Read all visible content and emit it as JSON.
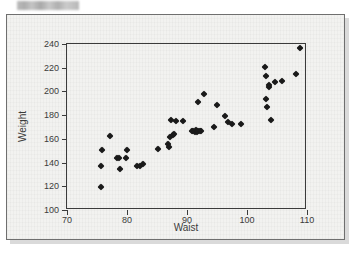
{
  "figure": {
    "redacted_caption": "",
    "background_color": "#f2f2f0",
    "frame_color": "#3b3b3b",
    "marker_color": "#1a1a1a"
  },
  "chart_data": {
    "type": "scatter",
    "title": "",
    "xlabel": "Waist",
    "ylabel": "Weight",
    "xlim": [
      70,
      110
    ],
    "ylim": [
      100,
      240
    ],
    "xticks": [
      70,
      80,
      90,
      100,
      110
    ],
    "yticks": [
      100,
      120,
      140,
      160,
      180,
      200,
      220,
      240
    ],
    "grid": false,
    "legend": null,
    "marker": "diamond",
    "points": [
      [
        75.6,
        119.8
      ],
      [
        75.6,
        137.4
      ],
      [
        75.9,
        151.0
      ],
      [
        77.1,
        162.0
      ],
      [
        78.4,
        144.2
      ],
      [
        78.6,
        143.5
      ],
      [
        78.9,
        135.0
      ],
      [
        79.8,
        143.8
      ],
      [
        80.0,
        151.0
      ],
      [
        81.6,
        137.0
      ],
      [
        82.1,
        137.3
      ],
      [
        82.6,
        138.8
      ],
      [
        85.2,
        151.5
      ],
      [
        86.8,
        155.8
      ],
      [
        87.0,
        152.8
      ],
      [
        87.2,
        161.6
      ],
      [
        87.4,
        175.5
      ],
      [
        87.6,
        163.2
      ],
      [
        87.8,
        164.0
      ],
      [
        88.2,
        175.3
      ],
      [
        89.3,
        175.0
      ],
      [
        90.8,
        166.6
      ],
      [
        91.0,
        167.0
      ],
      [
        91.3,
        166.2
      ],
      [
        91.5,
        167.3
      ],
      [
        91.6,
        165.8
      ],
      [
        91.8,
        166.4
      ],
      [
        91.9,
        191.0
      ],
      [
        92.1,
        166.8
      ],
      [
        92.4,
        166.3
      ],
      [
        92.8,
        197.5
      ],
      [
        94.5,
        170.3
      ],
      [
        95.0,
        188.8
      ],
      [
        96.4,
        179.0
      ],
      [
        96.8,
        174.0
      ],
      [
        97.5,
        172.8
      ],
      [
        99.0,
        172.5
      ],
      [
        103.0,
        220.8
      ],
      [
        103.1,
        213.0
      ],
      [
        103.2,
        194.0
      ],
      [
        103.4,
        186.6
      ],
      [
        103.6,
        203.8
      ],
      [
        103.7,
        205.2
      ],
      [
        104.0,
        176.0
      ],
      [
        104.6,
        208.0
      ],
      [
        105.8,
        209.0
      ],
      [
        108.1,
        214.6
      ],
      [
        108.8,
        236.8
      ]
    ]
  }
}
